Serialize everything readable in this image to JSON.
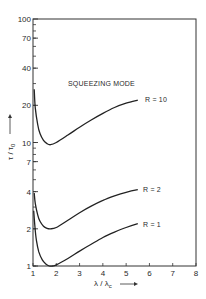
{
  "chart_data": {
    "type": "line",
    "title": "",
    "annotation": "SQUEEZING MODE",
    "xlabel": "λ / λc",
    "ylabel": "τ / τ0",
    "xlim": [
      1,
      8
    ],
    "ylim": [
      1,
      100
    ],
    "yscale": "log",
    "grid": false,
    "x_ticks": [
      1,
      2,
      3,
      4,
      5,
      6,
      7,
      8
    ],
    "y_ticks": [
      1,
      2,
      4,
      7,
      10,
      20,
      40,
      70,
      100
    ],
    "series": [
      {
        "name": "R = 10",
        "x": [
          1.05,
          1.1,
          1.2,
          1.3,
          1.45,
          1.6,
          1.75,
          2.0,
          2.5,
          3.0,
          3.5,
          4.0,
          4.5,
          5.0,
          5.5
        ],
        "values": [
          27,
          19,
          14,
          11.8,
          10.4,
          9.8,
          9.6,
          10.0,
          11.5,
          13.3,
          15.2,
          17.2,
          19.2,
          20.8,
          22.0
        ]
      },
      {
        "name": "R = 2",
        "x": [
          1.05,
          1.1,
          1.2,
          1.3,
          1.45,
          1.6,
          1.75,
          2.0,
          2.5,
          3.0,
          3.5,
          4.0,
          4.5,
          5.0,
          5.5
        ],
        "values": [
          3.9,
          3.2,
          2.6,
          2.3,
          2.1,
          2.02,
          2.0,
          2.05,
          2.35,
          2.7,
          3.05,
          3.4,
          3.7,
          3.95,
          4.15
        ]
      },
      {
        "name": "R = 1",
        "x": [
          1.03,
          1.08,
          1.15,
          1.25,
          1.4,
          1.55,
          1.7,
          1.85,
          2.0,
          2.5,
          3.0,
          3.5,
          4.0,
          4.5,
          5.0,
          5.5
        ],
        "values": [
          2.8,
          2.1,
          1.6,
          1.3,
          1.12,
          1.04,
          1.0,
          1.0,
          1.02,
          1.15,
          1.32,
          1.5,
          1.7,
          1.88,
          2.05,
          2.2
        ]
      }
    ]
  },
  "labels": {
    "annotation": "SQUEEZING MODE",
    "series_r10": "R = 10",
    "series_r2": "R = 2",
    "series_r1": "R = 1",
    "xlabel_main": "λ / λ",
    "xlabel_sub": "c",
    "ylabel_main": "τ / τ",
    "ylabel_sub": "0"
  }
}
